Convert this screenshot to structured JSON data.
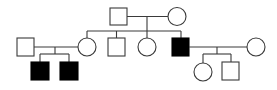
{
  "diagram": {
    "type": "pedigree",
    "generations": [
      {
        "label": "I",
        "individuals": [
          {
            "id": "I-1",
            "sex": "male",
            "affected": false
          },
          {
            "id": "I-2",
            "sex": "female",
            "affected": false
          }
        ]
      },
      {
        "label": "II",
        "individuals": [
          {
            "id": "II-spouse-left",
            "sex": "male",
            "affected": false,
            "married_in": true
          },
          {
            "id": "II-1",
            "sex": "female",
            "affected": false
          },
          {
            "id": "II-2",
            "sex": "male",
            "affected": false
          },
          {
            "id": "II-3",
            "sex": "female",
            "affected": false
          },
          {
            "id": "II-4",
            "sex": "male",
            "affected": true
          },
          {
            "id": "II-spouse-right",
            "sex": "female",
            "affected": false,
            "married_in": true
          }
        ]
      },
      {
        "label": "III",
        "individuals": [
          {
            "id": "III-1",
            "sex": "male",
            "affected": true,
            "parents": [
              "II-spouse-left",
              "II-1"
            ]
          },
          {
            "id": "III-2",
            "sex": "male",
            "affected": true,
            "parents": [
              "II-spouse-left",
              "II-1"
            ]
          },
          {
            "id": "III-3",
            "sex": "female",
            "affected": false,
            "parents": [
              "II-4",
              "II-spouse-right"
            ]
          },
          {
            "id": "III-4",
            "sex": "male",
            "affected": false,
            "parents": [
              "II-4",
              "II-spouse-right"
            ]
          }
        ]
      }
    ],
    "legend": {
      "square": "male",
      "circle": "female",
      "filled": "affected",
      "open": "unaffected"
    },
    "colors": {
      "line": "#3a3a3a",
      "affected_fill": "#000000",
      "unaffected_fill": "#ffffff"
    }
  }
}
